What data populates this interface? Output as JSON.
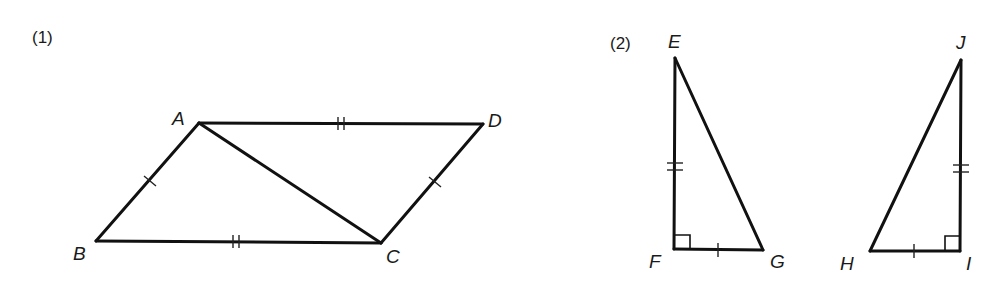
{
  "figure": {
    "width": 1004,
    "height": 283,
    "background": "#ffffff",
    "stroke_color": "#111111"
  },
  "problems": [
    {
      "id": "1",
      "label": "(1)",
      "label_pos": [
        32,
        43
      ],
      "shape": "parallelogram ABCD with diagonal AC",
      "vertices": {
        "A": {
          "x": 199,
          "y": 123,
          "label": "A",
          "label_pos": [
            172,
            125
          ]
        },
        "B": {
          "x": 96,
          "y": 241,
          "label": "B",
          "label_pos": [
            73,
            260
          ]
        },
        "C": {
          "x": 381,
          "y": 243,
          "label": "C",
          "label_pos": [
            386,
            263
          ]
        },
        "D": {
          "x": 483,
          "y": 124,
          "label": "D",
          "label_pos": [
            488,
            127
          ]
        }
      },
      "edges": [
        [
          "A",
          "D"
        ],
        [
          "D",
          "C"
        ],
        [
          "C",
          "B"
        ],
        [
          "B",
          "A"
        ],
        [
          "A",
          "C"
        ]
      ],
      "tick_marks": [
        {
          "edge": [
            "A",
            "D"
          ],
          "count": 2
        },
        {
          "edge": [
            "B",
            "C"
          ],
          "count": 2
        },
        {
          "edge": [
            "A",
            "B"
          ],
          "count": 1
        },
        {
          "edge": [
            "D",
            "C"
          ],
          "count": 1
        }
      ]
    },
    {
      "id": "2",
      "label": "(2)",
      "label_pos": [
        610,
        49
      ],
      "shape": "two right triangles EFG and JIH",
      "triangles": [
        {
          "name": "EFG",
          "vertices": {
            "E": {
              "x": 675,
              "y": 58,
              "label": "E",
              "label_pos": [
                668,
                48
              ]
            },
            "F": {
              "x": 674,
              "y": 249,
              "label": "F",
              "label_pos": [
                649,
                268
              ]
            },
            "G": {
              "x": 763,
              "y": 250,
              "label": "G",
              "label_pos": [
                770,
                268
              ]
            }
          },
          "right_angle_at": "F",
          "tick_marks": [
            {
              "edge": [
                "E",
                "F"
              ],
              "count": 2
            },
            {
              "edge": [
                "F",
                "G"
              ],
              "count": 1
            }
          ]
        },
        {
          "name": "HIJ",
          "vertices": {
            "H": {
              "x": 870,
              "y": 251,
              "label": "H",
              "label_pos": [
                840,
                270
              ]
            },
            "I": {
              "x": 960,
              "y": 251,
              "label": "I",
              "label_pos": [
                966,
                270
              ]
            },
            "J": {
              "x": 961,
              "y": 60,
              "label": "J",
              "label_pos": [
                956,
                49
              ]
            }
          },
          "right_angle_at": "I",
          "tick_marks": [
            {
              "edge": [
                "J",
                "I"
              ],
              "count": 2
            },
            {
              "edge": [
                "H",
                "I"
              ],
              "count": 1
            }
          ]
        }
      ]
    }
  ]
}
